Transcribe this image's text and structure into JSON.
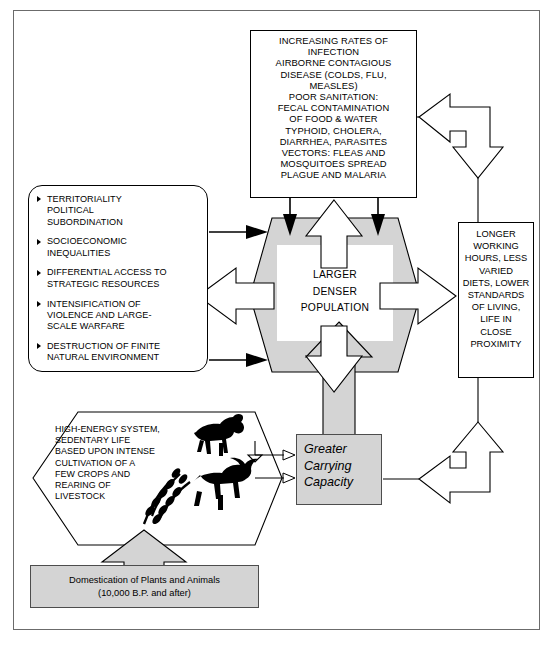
{
  "diagram": {
    "frame_color": "#6b6b6b",
    "fill_gray": "#d4d4d4",
    "line_color": "#000000"
  },
  "infection_box": {
    "name": "increasing-rates-of-infection",
    "lines": [
      "INCREASING RATES OF",
      "INFECTION",
      "AIRBORNE CONTAGIOUS",
      "DISEASE (COLDS, FLU,",
      "MEASLES)",
      "POOR SANITATION:",
      "FECAL CONTAMINATION",
      "OF FOOD & WATER",
      "TYPHOID, CHOLERA,",
      "DIARRHEA, PARASITES",
      "VECTORS: FLEAS AND",
      "MOSQUITOES SPREAD",
      "PLAGUE AND MALARIA"
    ]
  },
  "consequences_box": {
    "name": "social-consequences",
    "bullets": [
      [
        "TERRITORIALITY",
        "POLITICAL",
        "SUBORDINATION"
      ],
      [
        "SOCIOECONOMIC",
        "INEQUALITIES"
      ],
      [
        "DIFFERENTIAL ACCESS TO",
        "STRATEGIC RESOURCES"
      ],
      [
        "INTENSIFICATION OF",
        "VIOLENCE AND LARGE-",
        "SCALE WARFARE"
      ],
      [
        "DESTRUCTION OF FINITE",
        "NATURAL ENVIRONMENT"
      ]
    ]
  },
  "population_node": {
    "name": "larger-denser-population",
    "lines": [
      "LARGER",
      "DENSER",
      "POPULATION"
    ]
  },
  "conditions_box": {
    "name": "living-conditions",
    "lines": [
      "LONGER",
      "WORKING",
      "HOURS, LESS",
      "VARIED",
      "DIETS, LOWER",
      "STANDARDS",
      "OF LIVING,",
      "LIFE IN",
      "CLOSE",
      "PROXIMITY"
    ]
  },
  "agriculture_node": {
    "name": "high-energy-system",
    "lines": [
      "HIGH-ENERGY SYSTEM,",
      "SEDENTARY LIFE",
      "BASED UPON INTENSE",
      "CULTIVATION OF A",
      "FEW CROPS AND",
      "REARING OF",
      "LIVESTOCK"
    ],
    "icons": [
      "goat-icon",
      "cow-icon",
      "wheat-icon"
    ]
  },
  "carrying_capacity": {
    "name": "greater-carrying-capacity",
    "lines": [
      "Greater",
      "Carrying",
      "Capacity"
    ]
  },
  "domestication_box": {
    "name": "domestication-of-plants-and-animals",
    "lines": [
      "Domestication of Plants and Animals",
      "(10,000 B.P. and after)"
    ]
  },
  "connectors": [
    {
      "name": "infection-to-population-arrow-left",
      "style": "solid-black-down"
    },
    {
      "name": "infection-to-population-arrow-right",
      "style": "solid-black-down"
    },
    {
      "name": "population-to-infection-arrow",
      "style": "outline-white-up"
    },
    {
      "name": "consequences-to-population-arrow-top",
      "style": "solid-black-right"
    },
    {
      "name": "consequences-to-population-arrow-bottom",
      "style": "solid-black-right"
    },
    {
      "name": "population-to-consequences-arrow",
      "style": "outline-white-left"
    },
    {
      "name": "population-to-conditions-arrow",
      "style": "outline-white-right"
    },
    {
      "name": "conditions-to-infection-elbow-arrow",
      "style": "outline-white-elbow"
    },
    {
      "name": "carrying-to-conditions-elbow-arrow",
      "style": "outline-white-elbow"
    },
    {
      "name": "carrying-to-population-arrow",
      "style": "gray-up"
    },
    {
      "name": "population-to-carrying-arrow",
      "style": "outline-white-down"
    },
    {
      "name": "domestication-to-agriculture-arrow",
      "style": "gray-up"
    },
    {
      "name": "agriculture-to-carrying-arrow-upper",
      "style": "outline-right"
    },
    {
      "name": "agriculture-to-carrying-arrow-lower",
      "style": "outline-right"
    }
  ]
}
